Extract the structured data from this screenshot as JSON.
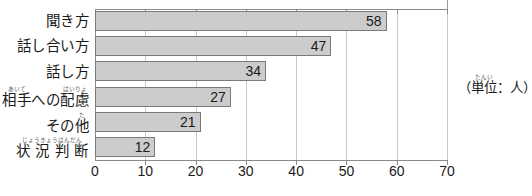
{
  "chart_data": {
    "type": "bar",
    "orientation": "horizontal",
    "title": "",
    "xlabel": "",
    "ylabel": "",
    "unit_note": "（単位：人）",
    "unit_note_ruby": "たんい",
    "xlim": [
      0,
      70
    ],
    "xticks": [
      "0",
      "10",
      "20",
      "30",
      "40",
      "50",
      "60",
      "70"
    ],
    "xtick_values": [
      0,
      10,
      20,
      30,
      40,
      50,
      60,
      70
    ],
    "grid": true,
    "legend": "none",
    "bar_color": "#cccccc",
    "bar_border_color": "#7a7a7a",
    "axis_color": "#8a8a8a",
    "gridline_color": "#c9c9c9",
    "categories": [
      "聞き方",
      "話し合い方",
      "話し方",
      "相手への配慮",
      "その他",
      "状況判断"
    ],
    "values": [
      58,
      47,
      34,
      27,
      21,
      12
    ],
    "value_labels": [
      "58",
      "47",
      "34",
      "27",
      "21",
      "12"
    ],
    "rows": [
      {
        "label": "聞き方",
        "value": 58,
        "value_label": "58",
        "ruby_parts": [
          {
            "base": "聞き方",
            "rt": ""
          }
        ]
      },
      {
        "label": "話し合い方",
        "value": 47,
        "value_label": "47",
        "ruby_parts": [
          {
            "base": "話し合い方",
            "rt": ""
          }
        ]
      },
      {
        "label": "話し方",
        "value": 34,
        "value_label": "34",
        "ruby_parts": [
          {
            "base": "話し方",
            "rt": ""
          }
        ]
      },
      {
        "label": "相手への配慮",
        "value": 27,
        "value_label": "27",
        "ruby_parts": [
          {
            "base": "相手",
            "rt": "あいて"
          },
          {
            "base": "への",
            "rt": ""
          },
          {
            "base": "配慮",
            "rt": "はいりょ"
          }
        ]
      },
      {
        "label": "その他",
        "value": 21,
        "value_label": "21",
        "ruby_parts": [
          {
            "base": "その",
            "rt": ""
          },
          {
            "base": "他",
            "rt": "た"
          }
        ]
      },
      {
        "label": "状況判断",
        "value": 12,
        "value_label": "12",
        "ruby_parts": [
          {
            "base": "状 況 判 断",
            "rt": "じょうきょうはんだん"
          }
        ]
      }
    ]
  }
}
